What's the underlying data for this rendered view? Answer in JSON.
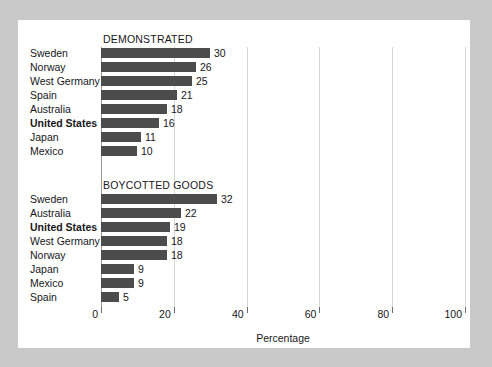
{
  "chart_data": {
    "type": "bar",
    "orientation": "horizontal",
    "title": "",
    "xlabel": "Percentage",
    "ylabel": "",
    "xlim": [
      0,
      100
    ],
    "xticks": [
      0,
      20,
      40,
      60,
      80,
      100
    ],
    "grid": true,
    "legend": null,
    "panels": [
      {
        "title": "DEMONSTRATED",
        "categories": [
          "Sweden",
          "Norway",
          "West Germany",
          "Spain",
          "Australia",
          "United States",
          "Japan",
          "Mexico"
        ],
        "values": [
          30,
          26,
          25,
          21,
          18,
          16,
          11,
          10
        ],
        "highlighted": [
          "United States"
        ]
      },
      {
        "title": "BOYCOTTED GOODS",
        "categories": [
          "Sweden",
          "Australia",
          "United States",
          "West Germany",
          "Norway",
          "Japan",
          "Mexico",
          "Spain"
        ],
        "values": [
          32,
          22,
          19,
          18,
          18,
          9,
          9,
          5
        ],
        "highlighted": [
          "United States"
        ]
      }
    ],
    "colors": {
      "bar": "#4c4c4c",
      "gridline": "#d6d6d6",
      "axis": "#6e6e6e",
      "text": "#17171a",
      "panel_background": "#ffffff",
      "page_background": "#c9c9c9"
    }
  }
}
